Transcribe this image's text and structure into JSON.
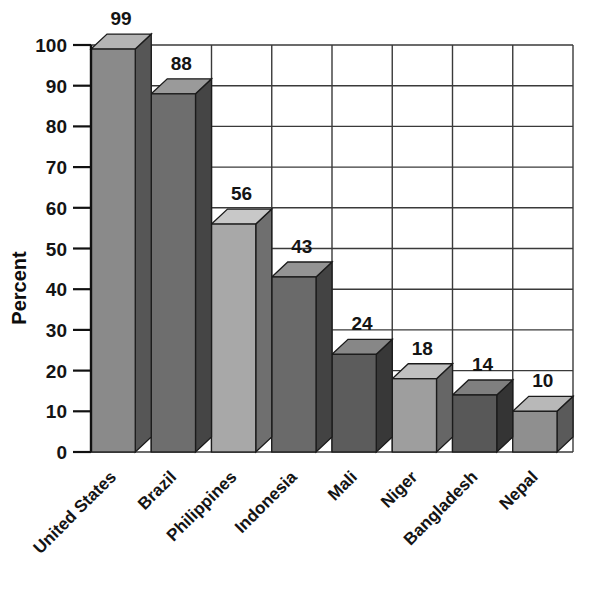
{
  "chart_data": {
    "type": "bar",
    "title": "",
    "subtitle": "",
    "xlabel": "",
    "ylabel": "Percent",
    "ylim": [
      0,
      100
    ],
    "ytick_step": 10,
    "yticks": [
      "0",
      "10",
      "20",
      "30",
      "40",
      "50",
      "60",
      "70",
      "80",
      "90",
      "100"
    ],
    "grid": "horizontal-and-vertical",
    "legend": "none",
    "style": "3d-bars-grayscale",
    "categories": [
      "United States",
      "Brazil",
      "Philippines",
      "Indonesia",
      "Mali",
      "Niger",
      "Bangladesh",
      "Nepal"
    ],
    "values": [
      99,
      88,
      56,
      43,
      24,
      18,
      14,
      10
    ],
    "value_labels": [
      "99",
      "88",
      "56",
      "43",
      "24",
      "18",
      "14",
      "10"
    ],
    "bar_colors": [
      "#8a8a8a",
      "#6e6e6e",
      "#a8a8a8",
      "#6a6a6a",
      "#5c5c5c",
      "#9e9e9e",
      "#585858",
      "#8f8f8f"
    ],
    "bar_top_colors": [
      "#b4b4b4",
      "#9a9a9a",
      "#c8c8c8",
      "#949494",
      "#878787",
      "#c0c0c0",
      "#7f7f7f",
      "#b8b8b8"
    ],
    "bar_side_colors": [
      "#565656",
      "#454545",
      "#6f6f6f",
      "#434343",
      "#383838",
      "#666666",
      "#343434",
      "#5a5a5a"
    ]
  },
  "axis": {
    "y_title": "Percent"
  }
}
